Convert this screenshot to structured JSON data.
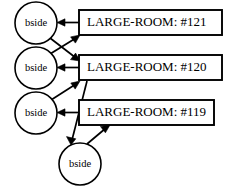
{
  "diagram": {
    "type": "node-link-graph",
    "canvas": {
      "width": 229,
      "height": 188,
      "background": "#ffffff"
    },
    "stroke_color": "#000000",
    "nodes": {
      "circles": [
        {
          "id": "bside-1",
          "label": "bside",
          "cx": 36,
          "cy": 23,
          "r": 21
        },
        {
          "id": "bside-2",
          "label": "bside",
          "cx": 36,
          "cy": 68,
          "r": 21
        },
        {
          "id": "bside-3",
          "label": "bside",
          "cx": 36,
          "cy": 113,
          "r": 21
        },
        {
          "id": "bside-4",
          "label": "bside",
          "cx": 80,
          "cy": 164,
          "r": 21
        }
      ],
      "boxes": [
        {
          "id": "room-121",
          "label": "LARGE-ROOM: #121",
          "x": 79,
          "y": 10,
          "width": 143,
          "height": 25
        },
        {
          "id": "room-120",
          "label": "LARGE-ROOM: #120",
          "x": 79,
          "y": 55,
          "width": 143,
          "height": 25
        },
        {
          "id": "room-119",
          "label": "LARGE-ROOM: #119",
          "x": 79,
          "y": 100,
          "width": 135,
          "height": 25
        }
      ]
    },
    "edges": [
      {
        "id": "e1",
        "from": "room-121",
        "to": "bside-1",
        "style": "horizontal-arrow"
      },
      {
        "id": "e2",
        "from": "room-120",
        "to": "bside-2",
        "style": "horizontal-arrow"
      },
      {
        "id": "e3",
        "from": "room-119",
        "to": "bside-3",
        "style": "horizontal-arrow"
      },
      {
        "id": "e4",
        "from": "bside-1",
        "to": "room-120",
        "style": "diagonal-arrow"
      },
      {
        "id": "e5",
        "from": "bside-2",
        "to": "room-121",
        "style": "diagonal-arrow"
      },
      {
        "id": "e6",
        "from": "bside-3",
        "to": "room-120",
        "style": "diagonal-arrow"
      },
      {
        "id": "e7",
        "from": "room-120",
        "to": "bside-4",
        "style": "diagonal-arrow"
      },
      {
        "id": "e8",
        "from": "bside-4",
        "to": "room-119",
        "style": "diagonal-arrow"
      }
    ]
  }
}
